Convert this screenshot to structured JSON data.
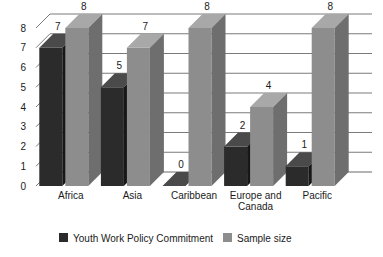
{
  "chart_data": {
    "type": "bar",
    "title": "",
    "subtitle": "",
    "xlabel": "",
    "ylabel": "",
    "ylim": [
      0,
      8
    ],
    "yticks": [
      "0",
      "1",
      "2",
      "3",
      "4",
      "5",
      "6",
      "7",
      "8"
    ],
    "grid": true,
    "three_d": true,
    "legend_position": "bottom",
    "categories": [
      "Africa",
      "Asia",
      "Caribbean",
      "Europe and Canada",
      "Pacific"
    ],
    "series": [
      {
        "name": "Youth Work Policy Commitment",
        "color": "#2b2b2b",
        "values": [
          7,
          5,
          0,
          2,
          1
        ],
        "labels": [
          "7",
          "5",
          "0",
          "2",
          "1"
        ]
      },
      {
        "name": "Sample size",
        "color": "#8d8d8d",
        "values": [
          8,
          7,
          8,
          4,
          8
        ],
        "labels": [
          "8",
          "7",
          "8",
          "4",
          "8"
        ]
      }
    ]
  },
  "legend": {
    "items": [
      {
        "label": "Youth Work Policy Commitment",
        "color": "#2b2b2b"
      },
      {
        "label": "Sample size",
        "color": "#8d8d8d"
      }
    ]
  },
  "axis": {
    "y_tick_labels": [
      "8",
      "7",
      "6",
      "5",
      "4",
      "3",
      "2",
      "1",
      "0"
    ]
  },
  "category_labels": [
    {
      "line1": "Africa",
      "line2": ""
    },
    {
      "line1": "Asia",
      "line2": ""
    },
    {
      "line1": "Caribbean",
      "line2": ""
    },
    {
      "line1": "Europe and",
      "line2": "Canada"
    },
    {
      "line1": "Pacific",
      "line2": ""
    }
  ],
  "value_labels": {
    "africa_dark": "7",
    "africa_light": "8",
    "asia_dark": "5",
    "asia_light": "7",
    "caribbean_dark": "0",
    "caribbean_light": "8",
    "europe_dark": "2",
    "europe_light": "4",
    "pacific_dark": "1",
    "pacific_light": "8"
  },
  "colors": {
    "dark_front": "#2b2b2b",
    "dark_top": "#4a4a4a",
    "dark_side": "#171717",
    "light_front": "#8d8d8d",
    "light_top": "#a8a8a8",
    "light_side": "#6e6e6e",
    "gridline": "#6b6b6b",
    "text": "#1a1a1a",
    "background": "#ffffff"
  }
}
